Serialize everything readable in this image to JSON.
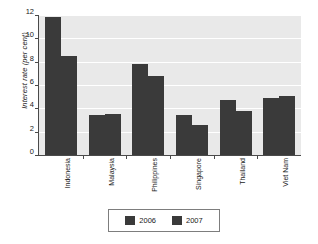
{
  "chart_data": {
    "type": "bar",
    "title": "",
    "xlabel": "",
    "ylabel": "Interest rate  (per cent)",
    "ylim": [
      0,
      12
    ],
    "yticks": [
      0,
      2,
      4,
      6,
      8,
      10,
      12
    ],
    "ytick_labels": [
      "0",
      "2",
      "4",
      "6",
      "8",
      "10",
      "12"
    ],
    "grid": true,
    "legend_position": "bottom",
    "categories": [
      "Indonesia",
      "Malaysia",
      "Philippines",
      "Singapore",
      "Thailand",
      "Viet Nam"
    ],
    "series": [
      {
        "name": "2006",
        "color": "#3a3a3a",
        "values": [
          11.8,
          3.4,
          7.8,
          3.4,
          4.7,
          4.9
        ]
      },
      {
        "name": "2007",
        "color": "#3a3a3a",
        "values": [
          8.5,
          3.5,
          6.8,
          2.6,
          3.8,
          5.1
        ]
      }
    ]
  },
  "legend": {
    "entries": [
      {
        "label": "2006",
        "color": "#3a3a3a"
      },
      {
        "label": "2007",
        "color": "#3a3a3a"
      }
    ]
  },
  "colors": {
    "bar": "#3a3a3a",
    "plot_background": "#e9e9e9",
    "gridline": "#ffffff",
    "axis": "#4a4a4a",
    "page_background": "#ffffff",
    "text": "#1a1a1a"
  }
}
